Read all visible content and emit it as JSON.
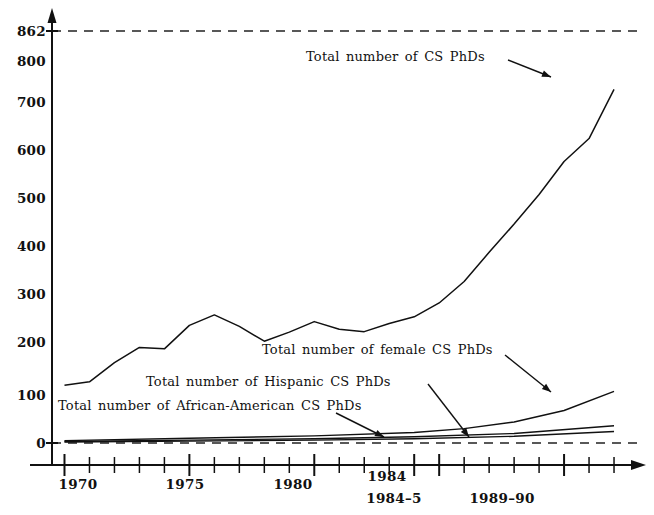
{
  "chart_data": {
    "type": "line",
    "title": "",
    "xlabel": "",
    "ylabel": "",
    "xlim": [
      1969.5,
      1993.2
    ],
    "ylim": [
      0,
      862
    ],
    "grid": false,
    "legend_position": "inline-annotations",
    "y_ticklabels": [
      "0",
      "100",
      "200",
      "300",
      "400",
      "500",
      "600",
      "700",
      "800",
      "862"
    ],
    "y_tickvalues": [
      0,
      100,
      200,
      300,
      400,
      500,
      600,
      700,
      800,
      862
    ],
    "x_ticklabels_primary": [
      "1970",
      "1975",
      "1980",
      "1984"
    ],
    "x_tickvalues_primary": [
      1970,
      1975,
      1980,
      1984
    ],
    "x_ticklabels_secondary": [
      "1984–5",
      "1989–90"
    ],
    "x_tickvalues_secondary": [
      1985,
      1990
    ],
    "reference_lines": [
      {
        "value": 862,
        "style": "dashed"
      },
      {
        "value": 0,
        "style": "dashed"
      }
    ],
    "series": [
      {
        "name": "Total number of CS PhDs",
        "x": [
          1970,
          1971,
          1972,
          1973,
          1974,
          1975,
          1976,
          1977,
          1978,
          1979,
          1980,
          1981,
          1982,
          1983,
          1984,
          1985,
          1986,
          1987,
          1988,
          1989,
          1990,
          1991,
          1992
        ],
        "values": [
          121,
          128,
          168,
          200,
          197,
          246,
          268,
          244,
          213,
          232,
          254,
          238,
          233,
          250,
          264,
          293,
          338,
          399,
          458,
          520,
          589,
          637,
          740
        ]
      },
      {
        "name": "Total number of female CS PhDs",
        "x": [
          1970,
          1975,
          1980,
          1984,
          1986,
          1988,
          1990,
          1992
        ],
        "values": [
          5,
          10,
          15,
          22,
          30,
          44,
          68,
          108
        ]
      },
      {
        "name": "Total number of Hispanic CS PhDs",
        "x": [
          1970,
          1975,
          1980,
          1984,
          1988,
          1992
        ],
        "values": [
          3,
          6,
          9,
          13,
          20,
          36
        ]
      },
      {
        "name": "Total number of African-American CS PhDs",
        "x": [
          1970,
          1975,
          1980,
          1984,
          1988,
          1992
        ],
        "values": [
          2,
          4,
          6,
          9,
          14,
          24
        ]
      }
    ],
    "annotations": [
      {
        "text": "Total number of CS PhDs",
        "target_series": "Total number of CS PhDs"
      },
      {
        "text": "Total number of female CS PhDs",
        "target_series": "Total number of female CS PhDs"
      },
      {
        "text": "Total number of Hispanic CS PhDs",
        "target_series": "Total number of Hispanic CS PhDs"
      },
      {
        "text": "Total number of African-American CS PhDs",
        "target_series": "Total number of African-American CS PhDs"
      }
    ],
    "colors": {
      "line": "#111111",
      "dashed": "#222222",
      "background": "#ffffff"
    }
  }
}
